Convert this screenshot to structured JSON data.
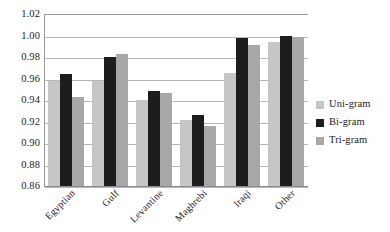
{
  "chart_data": {
    "type": "bar",
    "title": "",
    "subtitle": "",
    "xlabel": "",
    "ylabel": "",
    "categories": [
      "Egyptian",
      "Gulf",
      "Levantine",
      "Maghrebi",
      "Iraqi",
      "Other"
    ],
    "series": [
      {
        "name": "Uni-gram",
        "color": "#c6c6c6",
        "values": [
          0.958,
          0.958,
          0.94,
          0.9215,
          0.9655,
          0.994
        ]
      },
      {
        "name": "Bi-gram",
        "color": "#1d1d1d",
        "values": [
          0.9645,
          0.98,
          0.948,
          0.9265,
          0.9975,
          1.0
        ]
      },
      {
        "name": "Tri-gram",
        "color": "#a8a8a8",
        "values": [
          0.9425,
          0.983,
          0.9465,
          0.9155,
          0.991,
          0.999
        ]
      }
    ],
    "ylim": [
      0.86,
      1.02
    ],
    "ytick_step": 0.02,
    "ytick_labels": [
      "1.02",
      "1.00",
      "0.98",
      "0.96",
      "0.94",
      "0.92",
      "0.90",
      "0.88",
      "0.86"
    ],
    "ytick_values": [
      1.02,
      1.0,
      0.98,
      0.96,
      0.94,
      0.92,
      0.9,
      0.88,
      0.86
    ],
    "grid": true,
    "legend_position": "right",
    "xtick_rotation": -45
  }
}
